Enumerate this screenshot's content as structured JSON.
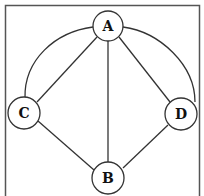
{
  "diagram": {
    "type": "graph",
    "nodes": [
      {
        "id": "A",
        "label": "A",
        "x": 108,
        "y": 26
      },
      {
        "id": "B",
        "label": "B",
        "x": 108,
        "y": 178
      },
      {
        "id": "C",
        "label": "C",
        "x": 24,
        "y": 113
      },
      {
        "id": "D",
        "label": "D",
        "x": 181,
        "y": 114
      }
    ],
    "edges": [
      {
        "from": "A",
        "to": "C",
        "style": "straight"
      },
      {
        "from": "A",
        "to": "B",
        "style": "straight"
      },
      {
        "from": "A",
        "to": "D",
        "style": "straight"
      },
      {
        "from": "C",
        "to": "B",
        "style": "straight"
      },
      {
        "from": "D",
        "to": "B",
        "style": "straight"
      },
      {
        "from": "A",
        "to": "C",
        "style": "arc"
      },
      {
        "from": "A",
        "to": "D",
        "style": "arc"
      }
    ],
    "colors": {
      "stroke": "#333333",
      "fill": "#ffffff",
      "frame": "#555555"
    }
  }
}
